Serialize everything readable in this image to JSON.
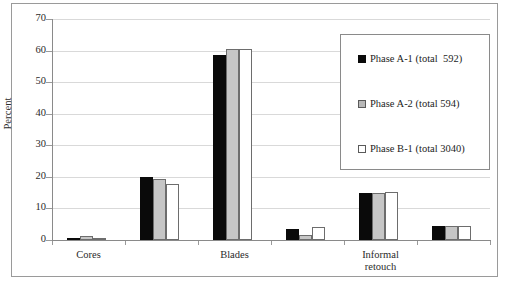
{
  "chart_data": {
    "type": "bar",
    "title": "",
    "xlabel": "",
    "ylabel": "Percent",
    "ylim": [
      0,
      70
    ],
    "yticks": [
      0,
      10,
      20,
      30,
      40,
      50,
      60,
      70
    ],
    "ytick_labels": [
      "0",
      "10",
      "20",
      "30",
      "40",
      "50",
      "60",
      "70"
    ],
    "grid": true,
    "legend_position": "upper right",
    "categories": [
      "Cores",
      "",
      "Blades",
      "",
      "Informal\nretouch",
      ""
    ],
    "visible_category_labels": [
      "Cores",
      "Blades",
      "Informal\nretouch"
    ],
    "series": [
      {
        "name": "Phase A-1 (total  592)",
        "swatch": "s0",
        "color": "#0a0a0a",
        "values": [
          0.5,
          20.0,
          58.5,
          3.5,
          15.0,
          4.3
        ]
      },
      {
        "name": "Phase A-2 (total 594)",
        "swatch": "s1",
        "color": "#c6c6c6",
        "values": [
          1.3,
          19.3,
          60.5,
          1.5,
          15.0,
          4.3
        ]
      },
      {
        "name": "Phase B-1 (total 3040)",
        "swatch": "s2",
        "color": "#ffffff",
        "values": [
          0.7,
          17.7,
          60.5,
          4.0,
          15.2,
          4.3
        ]
      }
    ]
  },
  "axis": {
    "y_title": "Percent"
  },
  "legend": {
    "entries": [
      {
        "label": "Phase A-1 (total  592)",
        "swatch": "s0"
      },
      {
        "label": "Phase A-2 (total 594)",
        "swatch": "s1"
      },
      {
        "label": "Phase B-1 (total 3040)",
        "swatch": "s2"
      }
    ]
  }
}
